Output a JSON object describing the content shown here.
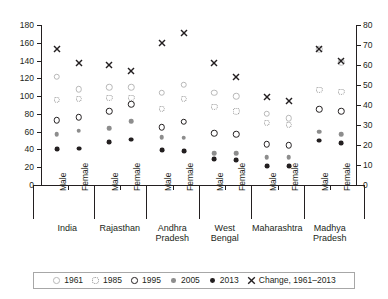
{
  "chart_data": {
    "type": "scatter",
    "title": "",
    "subtitle": "",
    "xlabel": "",
    "ylabel": "",
    "y2label": "",
    "ylim": [
      0,
      180
    ],
    "y2lim": [
      0,
      80
    ],
    "yticks": [
      0,
      20,
      40,
      60,
      80,
      100,
      120,
      140,
      160,
      180
    ],
    "y2ticks": [
      0,
      10,
      20,
      30,
      40,
      50,
      60,
      70,
      80
    ],
    "grid": false,
    "legend_position": "bottom",
    "legend": [
      {
        "label": "1961",
        "marker": "open-circle-light"
      },
      {
        "label": "1985",
        "marker": "dotted-circle"
      },
      {
        "label": "1995",
        "marker": "open-circle-bold"
      },
      {
        "label": "2005",
        "marker": "filled-circle-gray"
      },
      {
        "label": "2013",
        "marker": "filled-circle-black"
      },
      {
        "label": "Change, 1961–2013",
        "marker": "cross"
      }
    ],
    "regions": [
      "India",
      "Rajasthan",
      "Andhra\nPradesh",
      "West\nBengal",
      "Maharashtra",
      "Madhya\nPradesh"
    ],
    "sexes": [
      "Male",
      "Female"
    ],
    "categories": [
      "India Male",
      "India Female",
      "Rajasthan Male",
      "Rajasthan Female",
      "Andhra Pradesh Male",
      "Andhra Pradesh Female",
      "West Bengal Male",
      "West Bengal Female",
      "Maharashtra Male",
      "Maharashtra Female",
      "Madhya Pradesh Male",
      "Madhya Pradesh Female"
    ],
    "series": [
      {
        "name": "1961",
        "axis": "left",
        "values": [
          122,
          108,
          110,
          110,
          104,
          113,
          104,
          100,
          80,
          75,
          153,
          138
        ]
      },
      {
        "name": "1985",
        "axis": "left",
        "values": [
          96,
          97,
          98,
          98,
          86,
          97,
          88,
          83,
          70,
          68,
          107,
          105
        ]
      },
      {
        "name": "1995",
        "axis": "left",
        "values": [
          73,
          76,
          83,
          91,
          65,
          71,
          58,
          57,
          46,
          45,
          85,
          83
        ]
      },
      {
        "name": "2005",
        "axis": "left",
        "values": [
          57,
          61,
          64,
          72,
          54,
          53,
          36,
          36,
          31,
          31,
          60,
          57
        ]
      },
      {
        "name": "2013",
        "axis": "left",
        "values": [
          40,
          41,
          48,
          51,
          39,
          38,
          29,
          28,
          21,
          21,
          50,
          47
        ]
      },
      {
        "name": "Change, 1961–2013",
        "axis": "right",
        "values": [
          68,
          61,
          60,
          57,
          71,
          76,
          61,
          54,
          44,
          42,
          68,
          62
        ]
      }
    ]
  },
  "axes": {
    "left_ticks": [
      "180",
      "160",
      "140",
      "120",
      "100",
      "80",
      "60",
      "40",
      "20",
      "0"
    ],
    "right_ticks": [
      "80",
      "70",
      "60",
      "50",
      "40",
      "30",
      "20",
      "10",
      "0"
    ]
  },
  "xaxis": {
    "groups": [
      {
        "region": "India",
        "sexes": [
          "Male",
          "Female"
        ]
      },
      {
        "region": "Rajasthan",
        "sexes": [
          "Male",
          "Female"
        ]
      },
      {
        "region": "Andhra\nPradesh",
        "sexes": [
          "Male",
          "Female"
        ]
      },
      {
        "region": "West\nBengal",
        "sexes": [
          "Male",
          "Female"
        ]
      },
      {
        "region": "Maharashtra",
        "sexes": [
          "Male",
          "Female"
        ]
      },
      {
        "region": "Madhya\nPradesh",
        "sexes": [
          "Male",
          "Female"
        ]
      }
    ]
  },
  "legend": {
    "items": [
      {
        "label": "1961"
      },
      {
        "label": "1985"
      },
      {
        "label": "1995"
      },
      {
        "label": "2005"
      },
      {
        "label": "2013"
      },
      {
        "label": "Change, 1961–2013"
      }
    ]
  },
  "colors": {
    "ink": "#231f20",
    "gray": "#8d8d8d",
    "light": "#b8b8b8",
    "background": "#ffffff"
  }
}
